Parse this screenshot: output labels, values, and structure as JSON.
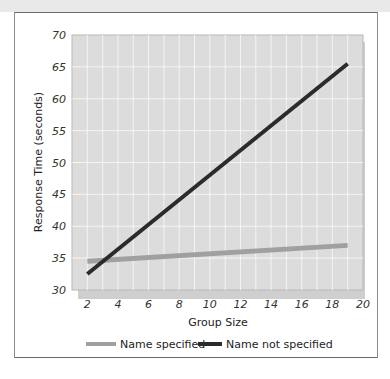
{
  "chart_data": {
    "type": "line",
    "title": "",
    "xlabel": "Group Size",
    "ylabel": "Response Time (seconds)",
    "xlim": [
      1,
      20
    ],
    "ylim": [
      30,
      70
    ],
    "x_ticks": [
      2,
      4,
      6,
      8,
      10,
      12,
      14,
      16,
      18,
      20
    ],
    "y_ticks": [
      30,
      35,
      40,
      45,
      50,
      55,
      60,
      65,
      70
    ],
    "grid": true,
    "legend_position": "bottom",
    "series": [
      {
        "name": "Name specified",
        "color": "#a0a0a0",
        "x": [
          2,
          19
        ],
        "values": [
          34.5,
          37.0
        ]
      },
      {
        "name": "Name not specified",
        "color": "#2b2b2b",
        "x": [
          2,
          19
        ],
        "values": [
          32.5,
          65.5
        ]
      }
    ]
  },
  "labels": {
    "xlabel": "Group Size",
    "ylabel": "Response Time (seconds)",
    "legend_1": "Name specified",
    "legend_2": "Name not specified"
  },
  "colors": {
    "plot_bg": "#dcdcdc",
    "grid": "#f4f4f4",
    "shadow": "#cfcfcf",
    "series_1": "#a0a0a0",
    "series_2": "#2b2b2b"
  }
}
